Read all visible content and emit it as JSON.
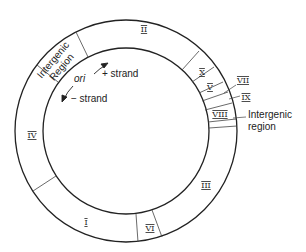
{
  "diagram": {
    "segments": [
      {
        "id": "intergenic-top",
        "label_lines": [
          "Intergenic",
          "Region"
        ]
      },
      {
        "id": "II",
        "label": "II"
      },
      {
        "id": "X",
        "label": "X"
      },
      {
        "id": "V",
        "label": "V"
      },
      {
        "id": "VII",
        "label": "VII"
      },
      {
        "id": "IX",
        "label": "IX"
      },
      {
        "id": "VIII",
        "label": "VIII"
      },
      {
        "id": "intergenic-right",
        "label_lines": [
          "Intergenic",
          "region"
        ]
      },
      {
        "id": "III",
        "label": "III"
      },
      {
        "id": "VI",
        "label": "VI"
      },
      {
        "id": "I",
        "label": "I"
      },
      {
        "id": "IV",
        "label": "IV"
      }
    ],
    "annotations": {
      "ori": "ori",
      "plus_strand": "+ strand",
      "minus_strand": "− strand"
    },
    "colors": {
      "line": "#222222",
      "background": "#ffffff"
    }
  }
}
